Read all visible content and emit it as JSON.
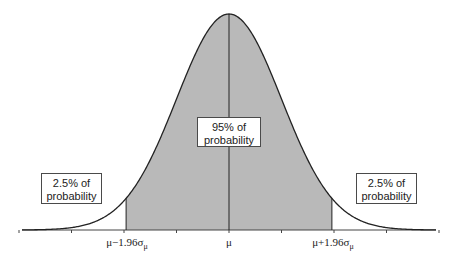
{
  "diagram": {
    "title": "",
    "type": "normal-distribution",
    "colors": {
      "shaded_fill": "#b9b9b9",
      "curve_stroke": "#222222",
      "axis_stroke": "#444444",
      "box_border": "#4a4a4a",
      "background": "#ffffff"
    },
    "regions": {
      "center": {
        "line1": "95% of",
        "line2": "probability"
      },
      "left_tail": {
        "line1": "2.5% of",
        "line2": "probability"
      },
      "right_tail": {
        "line1": "2.5% of",
        "line2": "probability"
      }
    },
    "axis_labels": {
      "left": {
        "base": "μ−1.96σ",
        "sub": "μ"
      },
      "center": {
        "base": "μ",
        "sub": ""
      },
      "right": {
        "base": "μ+1.96σ",
        "sub": "μ"
      }
    },
    "geometry": {
      "mean_x": 229,
      "sigma_px": 52.5,
      "baseline_y": 230,
      "peak_y": 14,
      "x_min": 22,
      "x_max": 436,
      "critical_z": 1.96,
      "tick_sigmas": [
        -4,
        -3,
        -2,
        -1,
        0,
        1,
        2,
        3,
        4
      ]
    }
  }
}
